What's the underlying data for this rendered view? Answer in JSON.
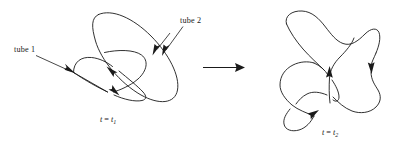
{
  "figure": {
    "background_color": "#ffffff",
    "ink_color": "#1a1a1a",
    "labels": {
      "tube_1": "tube 1",
      "tube_2": "tube 2"
    },
    "time_left": {
      "variable": "t",
      "equals": " = ",
      "value_base": "t",
      "value_sub": "1",
      "full": "t = t1"
    },
    "time_right": {
      "variable": "t",
      "equals": " = ",
      "value_base": "t",
      "value_sub": "2",
      "full": "t = t2"
    },
    "transition": {
      "icon": "right-arrow-icon",
      "direction": "right"
    },
    "panels": [
      {
        "name": "left-panel",
        "description": "Two linked closed vortex tubes before reconnection",
        "time_label": "t = t1",
        "curve_count": 2,
        "flow_arrows": 2
      },
      {
        "name": "right-panel",
        "description": "Single reconnected closed vortex tube after reconnection",
        "time_label": "t = t2",
        "curve_count": 1,
        "flow_arrows": 3
      }
    ],
    "pointers": [
      {
        "name": "tube-1-pointer",
        "label": "tube 1",
        "icon": "pointer-arrow-icon"
      },
      {
        "name": "tube-2-pointer",
        "label": "tube 2",
        "icon": "pointer-arrow-icon"
      }
    ]
  }
}
